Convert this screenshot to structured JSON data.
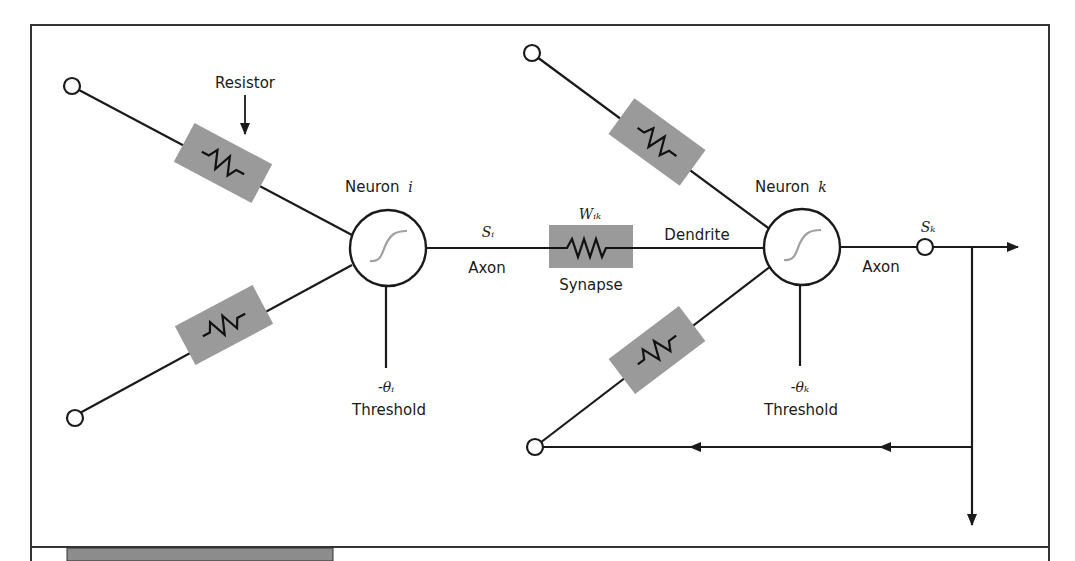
{
  "diagram": {
    "labels": {
      "resistor": "Resistor",
      "neuron_i": "Neuron",
      "neuron_i_index": "i",
      "neuron_k": "Neuron",
      "neuron_k_index": "k",
      "s_i": "Sᵢ",
      "w_ik": "Wᵢₖ",
      "s_k": "Sₖ",
      "axon_1": "Axon",
      "axon_2": "Axon",
      "synapse": "Synapse",
      "dendrite": "Dendrite",
      "theta_i": "-θᵢ",
      "theta_k": "-θₖ",
      "threshold_i": "Threshold",
      "threshold_k": "Threshold"
    },
    "colors": {
      "resistor_fill": "#9a9a9a",
      "line": "#1a1a1a",
      "sigmoid": "#a0a0a0",
      "footer_bar": "#8c8c8c"
    }
  }
}
